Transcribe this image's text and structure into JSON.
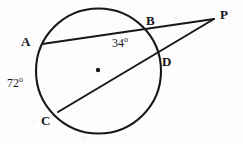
{
  "figure": {
    "stroke_color": "#17171a",
    "background_color": "#fdfdfd",
    "stroke_width": 1.9,
    "circle": {
      "cx": 98.5,
      "cy": 71,
      "r": 62.5
    },
    "center_dot": {
      "cx": 98,
      "cy": 70,
      "r": 2.2
    },
    "points": [
      {
        "key": "A",
        "label": "A",
        "x": 42,
        "y": 44,
        "label_x": 21,
        "label_y": 35
      },
      {
        "key": "B",
        "label": "B",
        "x": 144,
        "y": 33,
        "label_x": 146,
        "label_y": 14
      },
      {
        "key": "C",
        "label": "C",
        "x": 58,
        "y": 112,
        "label_x": 41,
        "label_y": 114
      },
      {
        "key": "D",
        "label": "D",
        "x": 157,
        "y": 52,
        "label_x": 162,
        "label_y": 55
      },
      {
        "key": "P",
        "label": "P",
        "x": 214,
        "y": 19,
        "label_x": 220,
        "label_y": 8
      }
    ],
    "segments": [
      {
        "name": "secant-a-b-p",
        "x1": 42,
        "y1": 44,
        "x2": 214,
        "y2": 19
      },
      {
        "name": "secant-c-d-p",
        "x1": 58,
        "y1": 112,
        "x2": 214,
        "y2": 19
      }
    ],
    "angles": [
      {
        "key": "angle-34",
        "value": "34",
        "degree_symbol": "o",
        "x": 112,
        "y": 36
      },
      {
        "key": "angle-72",
        "value": "72",
        "degree_symbol": "o",
        "x": 7,
        "y": 76
      }
    ]
  }
}
